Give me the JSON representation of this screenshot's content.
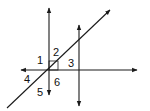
{
  "diagram": {
    "type": "geometry-lines-and-angles",
    "stroke_color": "#1a1a1a",
    "lines": [
      {
        "id": "vertical-line-left",
        "x1": 49,
        "y1": 8,
        "x2": 49,
        "y2": 95,
        "arrows": "both"
      },
      {
        "id": "vertical-line-right",
        "x1": 79,
        "y1": 25,
        "x2": 79,
        "y2": 106,
        "arrows": "both"
      },
      {
        "id": "horizontal-line",
        "x1": 21,
        "y1": 70,
        "x2": 137,
        "y2": 70,
        "arrows": "both"
      },
      {
        "id": "transversal-line",
        "x1": 7,
        "y1": 108,
        "x2": 110,
        "y2": 10,
        "arrows": "end"
      }
    ],
    "right_angle_marker": {
      "x": 49,
      "y": 61,
      "size": 9
    },
    "angle_labels": [
      {
        "text": "1",
        "x": 37,
        "y": 64
      },
      {
        "text": "2",
        "x": 53,
        "y": 56
      },
      {
        "text": "3",
        "x": 68,
        "y": 67
      },
      {
        "text": "4",
        "x": 24,
        "y": 83
      },
      {
        "text": "5",
        "x": 37,
        "y": 96
      },
      {
        "text": "6",
        "x": 54,
        "y": 86
      }
    ]
  }
}
